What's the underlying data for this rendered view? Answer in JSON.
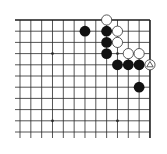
{
  "board": {
    "title": "Go problem diagram (top-right corner)",
    "colors": {
      "background": "#ffffff",
      "line": "#2a2a2a",
      "edge": "#1a1a1a",
      "black_stone": "#111111",
      "white_stone_fill": "#ffffff",
      "white_stone_stroke": "#333333",
      "marker": "#333333"
    },
    "grid": {
      "origin_x": 20,
      "origin_y": 20,
      "col_spacing": 10.83,
      "row_spacing": 11.2,
      "cols": 13,
      "rows": 11,
      "left_overhang": 5,
      "bottom_overhang": 6,
      "top_edge": true,
      "right_edge": true
    },
    "star_points": [
      {
        "col": 3,
        "row": 3
      },
      {
        "col": 9,
        "row": 3
      },
      {
        "col": 3,
        "row": 9
      },
      {
        "col": 9,
        "row": 9
      }
    ],
    "stone_radius": 5.4,
    "stones": [
      {
        "color": "white",
        "col": 8,
        "row": 0
      },
      {
        "color": "black",
        "col": 6,
        "row": 1
      },
      {
        "color": "black",
        "col": 8,
        "row": 1
      },
      {
        "color": "white",
        "col": 9,
        "row": 1
      },
      {
        "color": "black",
        "col": 8,
        "row": 2
      },
      {
        "color": "white",
        "col": 9,
        "row": 2
      },
      {
        "color": "black",
        "col": 8,
        "row": 3
      },
      {
        "color": "white",
        "col": 10,
        "row": 3
      },
      {
        "color": "white",
        "col": 11,
        "row": 3
      },
      {
        "color": "black",
        "col": 9,
        "row": 4
      },
      {
        "color": "black",
        "col": 10,
        "row": 4
      },
      {
        "color": "black",
        "col": 11,
        "row": 4
      },
      {
        "color": "white",
        "col": 12,
        "row": 4,
        "marker": "triangle"
      },
      {
        "color": "black",
        "col": 11,
        "row": 6
      }
    ]
  }
}
